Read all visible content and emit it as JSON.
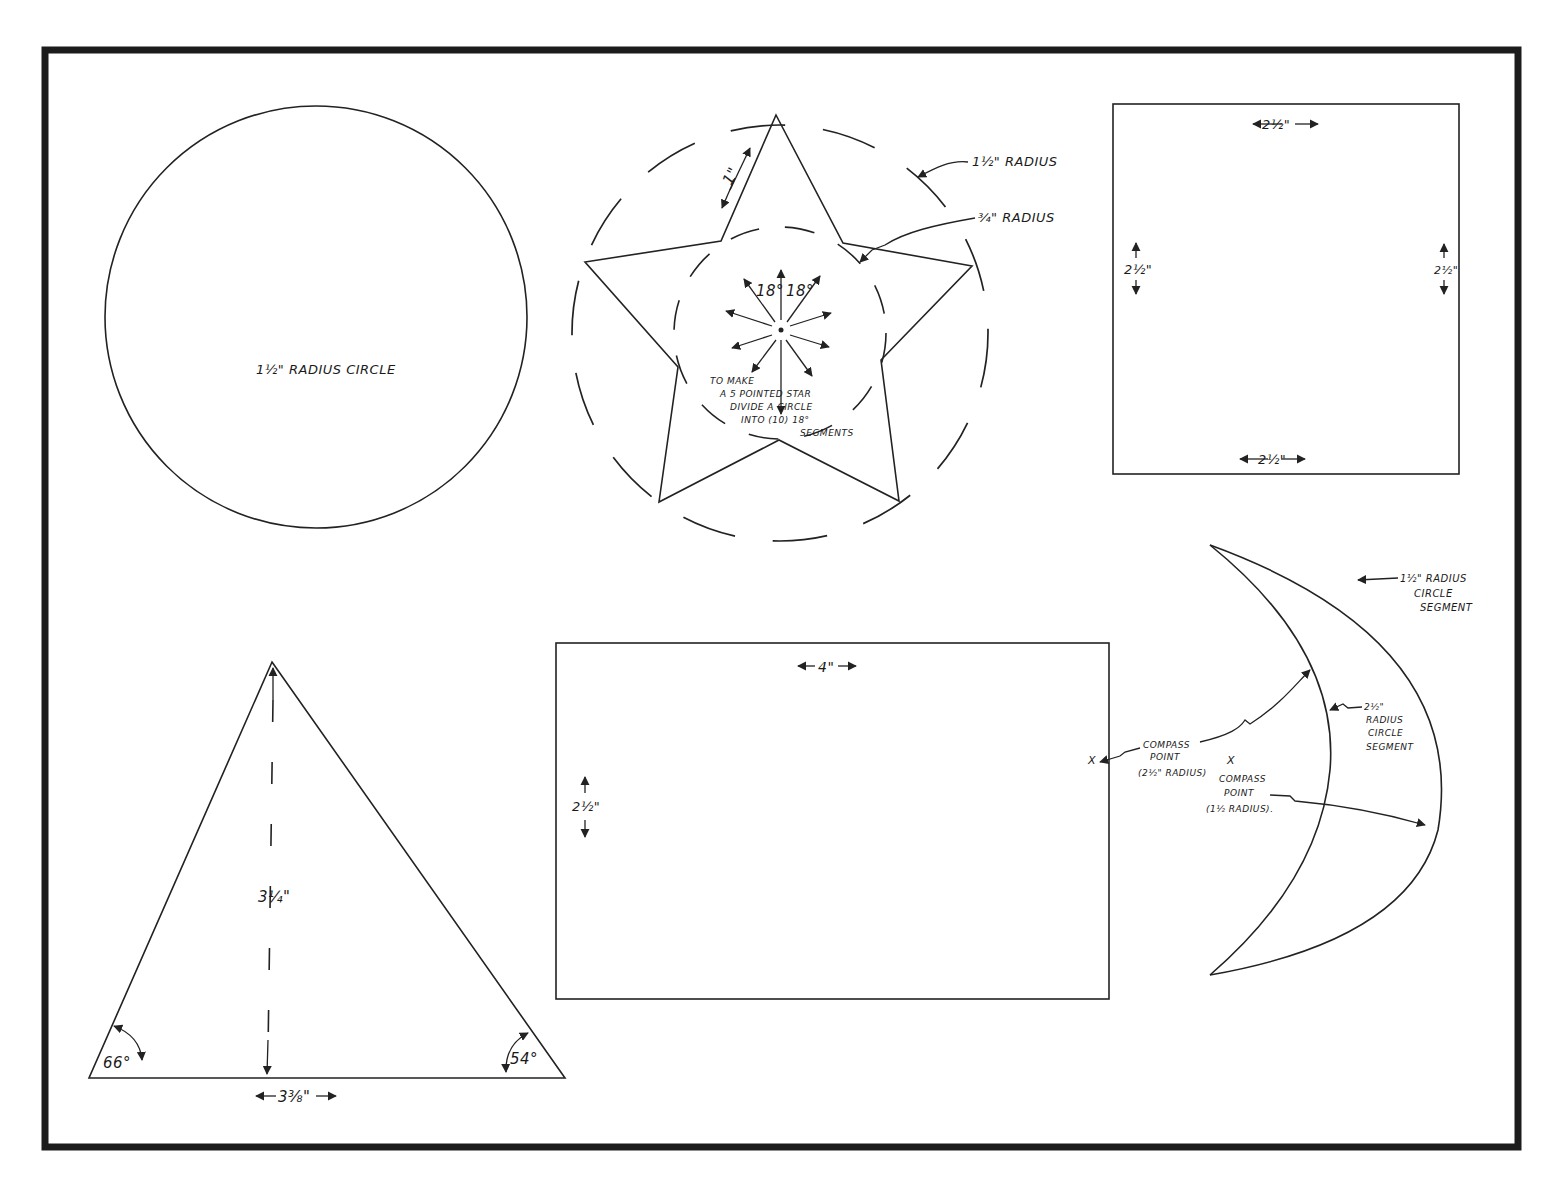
{
  "sheet": {
    "title": "Shape templates"
  },
  "circle": {
    "label": "1½\" RADIUS CIRCLE"
  },
  "star": {
    "side_label": "1\"",
    "outer_radius_label": "1½\" RADIUS",
    "inner_radius_label": "¾\" RADIUS",
    "angle_left": "18°",
    "angle_right": "18°",
    "instructions": [
      "TO MAKE",
      "A 5 POINTED STAR",
      "DIVIDE A CIRCLE",
      "INTO (10) 18°",
      "SEGMENTS"
    ]
  },
  "square": {
    "top_label": "2½\"",
    "bottom_label": "2½\"",
    "left_label": "2½\"",
    "right_label": "2½\""
  },
  "crescent": {
    "outer_label": [
      "1½\" RADIUS",
      "CIRCLE",
      "SEGMENT"
    ],
    "inner_label": [
      "2½\"",
      "RADIUS",
      "CIRCLE",
      "SEGMENT"
    ],
    "compass_a": [
      "COMPASS",
      "POINT",
      "(2½\" RADIUS)"
    ],
    "compass_b": [
      "COMPASS",
      "POINT",
      "(1½ RADIUS)."
    ],
    "x_mark": "X"
  },
  "rectangle": {
    "width_label": "4\"",
    "height_label": "2½\""
  },
  "triangle": {
    "height_label": "3¼\"",
    "base_label": "3⅜\"",
    "left_angle": "66°",
    "right_angle": "54°"
  }
}
